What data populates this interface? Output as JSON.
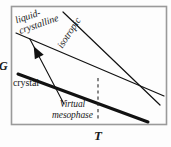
{
  "figure": {
    "type": "phase-diagram",
    "background": "#fdfdfd",
    "frame_color": "#9a9a9a",
    "line_color": "#111111"
  },
  "axes": {
    "y_label": "G",
    "x_label": "T"
  },
  "labels": {
    "liquid_crystalline_line1": "liquid-",
    "liquid_crystalline_line2": "crystalline",
    "isotropic": "isotropic",
    "crystal": "crystal",
    "virtual_mesophase_line1": "Virtual",
    "virtual_mesophase_line2": "mesophase"
  },
  "chart_data": {
    "type": "line",
    "title": "",
    "xlabel": "T",
    "ylabel": "G",
    "xlim": [
      0,
      1
    ],
    "ylim": [
      0,
      1
    ],
    "grid": false,
    "legend": "inline-annotations",
    "note": "Gibbs free energy G versus temperature T. Three straight free-energy lines (crystal, liquid-crystalline mesophase, isotropic liquid) with differing slopes. The crystal line is drawn heavy/bold; the mesophase line is metastable (virtual) because it lies above the crystal line at the crystal-isotropic crossing, so the mesophase never becomes the stable phase.",
    "series": [
      {
        "name": "crystal",
        "style": "thick-solid",
        "width_px": 3.0,
        "color": "#111111",
        "points_px": [
          [
            18,
            74
          ],
          [
            148,
            122
          ]
        ],
        "slope_sign": "negative-steep",
        "label": "crystal",
        "label_rotation_deg": 0
      },
      {
        "name": "liquid-crystalline",
        "style": "thin-solid",
        "width_px": 1.2,
        "color": "#111111",
        "points_px": [
          [
            16,
            33
          ],
          [
            164,
            96
          ]
        ],
        "slope_sign": "negative-shallow",
        "label": "liquid-crystalline",
        "label_rotation_deg": -19
      },
      {
        "name": "isotropic",
        "style": "thin-solid",
        "width_px": 1.2,
        "color": "#111111",
        "points_px": [
          [
            63,
            12
          ],
          [
            160,
            105
          ]
        ],
        "slope_sign": "negative-steep",
        "label": "isotropic",
        "label_rotation_deg": -57
      }
    ],
    "annotations": [
      {
        "name": "virtual-mesophase-dropline",
        "kind": "dashed-vertical",
        "x_px": 98,
        "y_from_px": 78,
        "y_to_px": 121,
        "meaning": "temperature of the virtual (metastable) mesophase transition"
      },
      {
        "name": "virtual-mesophase-leader",
        "kind": "arrow",
        "from_px": [
          64,
          104
        ],
        "to_px": [
          33,
          45
        ],
        "arrowhead": "solid-triangle-at-tip",
        "points_to": "liquid-crystalline line"
      }
    ],
    "intersections_px": [
      {
        "lines": [
          "crystal",
          "liquid-crystalline"
        ],
        "x": 93,
        "y": 101
      },
      {
        "lines": [
          "crystal",
          "isotropic"
        ],
        "x": 98,
        "y": 78
      },
      {
        "lines": [
          "liquid-crystalline",
          "isotropic"
        ],
        "x": 127,
        "y": 83
      }
    ]
  }
}
